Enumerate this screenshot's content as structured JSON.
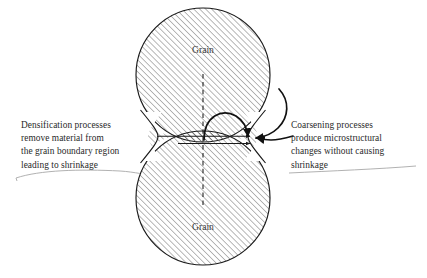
{
  "figure": {
    "background_color": "#ffffff",
    "stroke_color": "#1a1a1a",
    "hatch_color": "#555555",
    "underline_color": "#9a9a9a"
  },
  "grains": {
    "top_label": "Grain",
    "bottom_label": "Grain"
  },
  "captions": {
    "left": {
      "lines": [
        "Densification processes",
        "remove material from",
        "the grain boundary region",
        "leading to shrinkage"
      ],
      "line1": "Densification processes",
      "line2": "remove material from",
      "line3": "the grain boundary region",
      "line4": "leading to shrinkage"
    },
    "right": {
      "lines": [
        "Coarsening processes",
        "produce microstructural",
        "changes without causing",
        "shrinkage"
      ],
      "line1": "Coarsening processes",
      "line2": "produce microstructural",
      "line3": "changes without causing",
      "line4": "shrinkage"
    }
  },
  "annotations": {
    "vertical_dashed_axis": "grain-centerline",
    "horizontal_arrows": "neck-radius-arrows",
    "curved_arrow_inner": "grain-boundary-diffusion-arrow",
    "curved_arrow_outer_1": "surface-diffusion-arrow-upper",
    "curved_arrow_outer_2": "surface-diffusion-arrow-lower"
  }
}
